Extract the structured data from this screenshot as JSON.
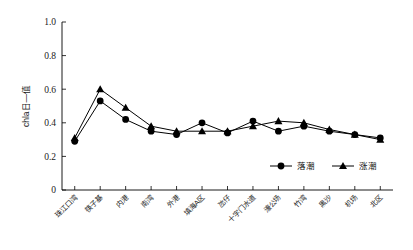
{
  "chart_data": {
    "type": "line",
    "title": "",
    "xlabel": "",
    "ylabel": "chla日—值",
    "ylim": [
      0,
      1.0
    ],
    "ytick_labels": [
      "0",
      "0.2",
      "0.4",
      "0.6",
      "0.8",
      "1.0"
    ],
    "ytick_values": [
      0,
      0.2,
      0.4,
      0.6,
      0.8,
      1.0
    ],
    "grid": false,
    "legend_position": "bottom-right",
    "categories": [
      "珠江口湾",
      "筷子基",
      "内港",
      "南湾",
      "外港",
      "填海A区",
      "氹仔",
      "十字门水道",
      "濠公场",
      "竹湾",
      "黑沙",
      "机场",
      "北区"
    ],
    "series": [
      {
        "name": "落潮",
        "marker": "circle",
        "values": [
          0.29,
          0.53,
          0.42,
          0.35,
          0.33,
          0.4,
          0.34,
          0.41,
          0.35,
          0.38,
          0.35,
          0.33,
          0.31
        ]
      },
      {
        "name": "涨潮",
        "marker": "triangle",
        "values": [
          0.31,
          0.6,
          0.49,
          0.38,
          0.35,
          0.35,
          0.35,
          0.38,
          0.41,
          0.4,
          0.36,
          0.33,
          0.3
        ]
      }
    ]
  },
  "legend": {
    "entries": [
      {
        "label": "落潮",
        "marker": "circle-marker-icon"
      },
      {
        "label": "涨潮",
        "marker": "triangle-marker-icon"
      }
    ]
  },
  "colors": {
    "axis": "#000000",
    "series_ebb": "#000000",
    "series_flood": "#000000",
    "background": "#ffffff"
  }
}
